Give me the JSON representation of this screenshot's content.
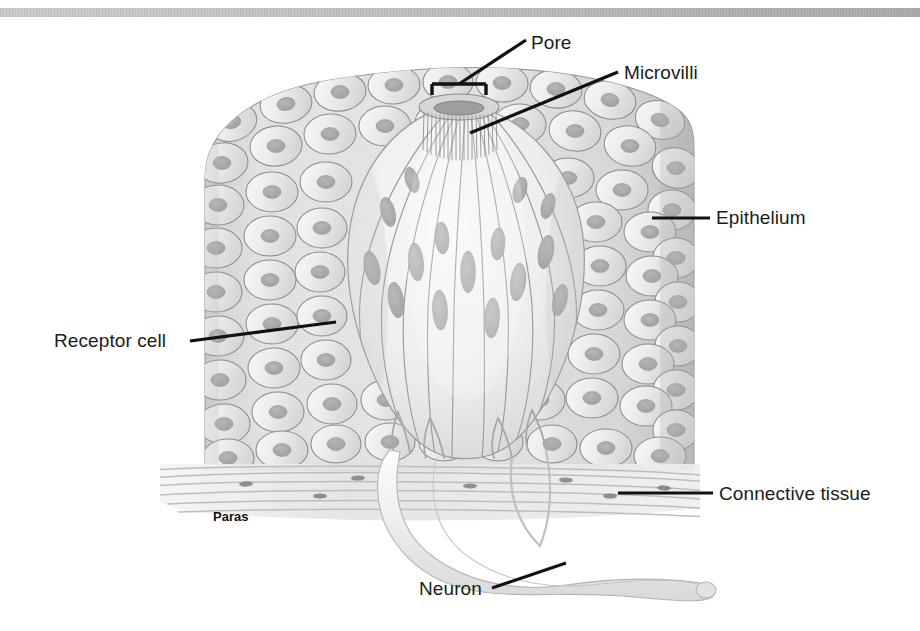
{
  "figure": {
    "kind": "anatomical-illustration",
    "background_color": "#ffffff",
    "ink_color": "#1b1b1b",
    "top_rule": {
      "name": "scan-edge-rule",
      "color_left": "#d8d8d8",
      "color_right": "#8d8d8d"
    }
  },
  "labels": {
    "pore": "Pore",
    "microvilli": "Microvilli",
    "epithelium": "Epithelium",
    "receptor_cell": "Receptor cell",
    "connective_tissue": "Connective tissue",
    "neuron": "Neuron",
    "paras": "Paras"
  },
  "leaders": {
    "pore": "leader-line-pore",
    "microvilli": "leader-line-microvilli",
    "epithelium": "leader-line-epithelium",
    "receptor_cell": "leader-line-receptor-cell",
    "connective_tissue": "leader-line-connective-tissue",
    "neuron": "leader-line-neuron"
  },
  "structures": {
    "epithelium_block": "stratified squamous epithelium block",
    "taste_bud": "onion-shaped taste bud",
    "taste_pore": "taste pore opening",
    "microvilli_tuft": "microvilli tuft",
    "pore_bracket": "pore measurement bracket",
    "receptor_cells": "spindle-shaped receptor cells",
    "basal_nerve_fibers": "basal nerve fibers",
    "connective_tissue_band": "connective tissue fiber band",
    "neuron_axon": "sensory neuron axon"
  },
  "palette": {
    "epithelium_fill": "#e3e3e3",
    "epithelium_outline": "#8f8f8f",
    "nucleus": "#a9a9a9",
    "bud_fill": "#efefef",
    "bud_outline": "#9a9a9a",
    "connective_fiber": "#c9c9c9",
    "neuron_fill": "#f2f2f2"
  }
}
